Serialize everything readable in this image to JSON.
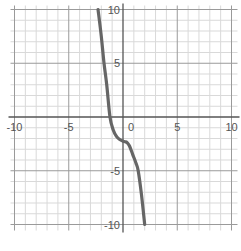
{
  "chart_data": {
    "type": "line",
    "title": "",
    "xlabel": "",
    "ylabel": "",
    "xlim": [
      -10,
      10
    ],
    "ylim": [
      -10,
      10
    ],
    "grid": true,
    "grid_step": 1,
    "x_ticks": [
      {
        "value": -10,
        "label": "-10"
      },
      {
        "value": -5,
        "label": "-5"
      },
      {
        "value": 0,
        "label": "0"
      },
      {
        "value": 5,
        "label": "5"
      },
      {
        "value": 10,
        "label": "10"
      }
    ],
    "y_ticks": [
      {
        "value": 10,
        "label": "10"
      },
      {
        "value": 5,
        "label": "5"
      },
      {
        "value": -5,
        "label": "-5"
      },
      {
        "value": -10,
        "label": "-10"
      }
    ],
    "series": [
      {
        "name": "curve",
        "color": "#666666",
        "x": [
          -2.3,
          -2.0,
          -1.75,
          -1.5,
          -1.2,
          -0.9,
          -0.6,
          -0.3,
          0.0,
          0.2,
          0.4,
          0.6,
          0.9,
          1.2,
          1.4,
          1.7,
          2.0
        ],
        "y": [
          10,
          7.5,
          5,
          3,
          0,
          -1.2,
          -1.8,
          -2.1,
          -2.25,
          -2.3,
          -2.4,
          -2.7,
          -3.5,
          -4.3,
          -5,
          -7.2,
          -10
        ]
      }
    ]
  },
  "colors": {
    "background": "#ffffff",
    "grid_minor": "#d9d9d9",
    "grid_major": "#9a9a9a",
    "axis": "#555555",
    "curve": "#666666"
  }
}
